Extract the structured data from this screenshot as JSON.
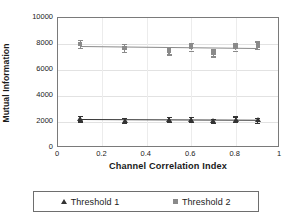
{
  "chart_data": {
    "type": "scatter",
    "title": "",
    "xlabel": "Channel Correlation Index",
    "ylabel": "Mutual Information",
    "xlim": [
      0,
      1
    ],
    "ylim": [
      0,
      10000
    ],
    "xticks": [
      "0",
      "0.2",
      "0.4",
      "0.6",
      "0.8",
      "1"
    ],
    "xtick_values": [
      0,
      0.2,
      0.4,
      0.6,
      0.8,
      1
    ],
    "yticks": [
      "0",
      "2000",
      "4000",
      "6000",
      "8000",
      "10000"
    ],
    "ytick_values": [
      0,
      2000,
      4000,
      6000,
      8000,
      10000
    ],
    "grid": true,
    "grid_axis": "both",
    "legend_position": "bottom",
    "x": [
      0.1,
      0.3,
      0.5,
      0.6,
      0.7,
      0.8,
      0.9
    ],
    "series": [
      {
        "name": "Threshold 1",
        "marker": "triangle",
        "color": "#333333",
        "values": [
          2250,
          2120,
          2200,
          2180,
          2080,
          2220,
          2150
        ],
        "errors": [
          200,
          180,
          200,
          190,
          180,
          210,
          190
        ],
        "trend_start": 2200,
        "trend_end": 2150
      },
      {
        "name": "Threshold 2",
        "marker": "square",
        "color": "#8a8a8a",
        "values": [
          8000,
          7700,
          7500,
          7800,
          7330,
          7800,
          7900
        ],
        "errors": [
          330,
          290,
          300,
          300,
          290,
          300,
          300
        ],
        "trend_start": 7850,
        "trend_end": 7700
      }
    ]
  },
  "legend": {
    "entries": [
      {
        "label": "Threshold 1",
        "marker": "triangle",
        "color": "#333333"
      },
      {
        "label": "Threshold 2",
        "marker": "square",
        "color": "#8a8a8a"
      }
    ]
  }
}
